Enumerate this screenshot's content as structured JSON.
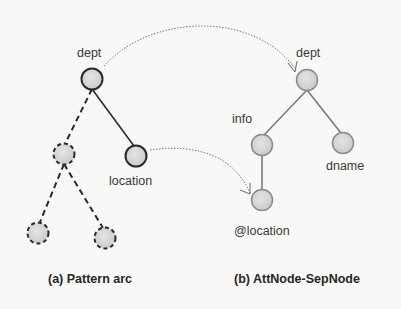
{
  "diagram": {
    "left_panel": {
      "caption": "(a) Pattern arc",
      "nodes": {
        "root": {
          "label": "dept"
        },
        "dashed_child": {
          "label": ""
        },
        "location": {
          "label": "location"
        },
        "dashed_grandchild_left": {
          "label": ""
        },
        "dashed_grandchild_right": {
          "label": ""
        }
      },
      "edges": [
        {
          "from": "dept",
          "to": "dashed_child",
          "style": "dashed"
        },
        {
          "from": "dept",
          "to": "location",
          "style": "solid"
        },
        {
          "from": "dashed_child",
          "to": "dashed_grandchild_left",
          "style": "dashed"
        },
        {
          "from": "dashed_child",
          "to": "dashed_grandchild_right",
          "style": "dashed"
        }
      ]
    },
    "right_panel": {
      "caption": "(b) AttNode-SepNode",
      "nodes": {
        "root": {
          "label": "dept"
        },
        "info": {
          "label": "info"
        },
        "dname": {
          "label": "dname"
        },
        "location": {
          "label": "@location"
        }
      },
      "edges": [
        {
          "from": "dept",
          "to": "info",
          "style": "solid"
        },
        {
          "from": "dept",
          "to": "dname",
          "style": "solid"
        },
        {
          "from": "info",
          "to": "@location",
          "style": "solid"
        }
      ]
    },
    "mappings": [
      {
        "from": "(a) dept",
        "to": "(b) dept",
        "style": "dotted-arrow"
      },
      {
        "from": "(a) location",
        "to": "(b) @location",
        "style": "dotted-arrow"
      }
    ],
    "colors": {
      "node_fill": "#d6d6d6",
      "left_node_stroke": "#2a2a2a",
      "right_node_stroke": "#8a8a8a",
      "dotted_arrow": "#7a7a7a"
    }
  }
}
